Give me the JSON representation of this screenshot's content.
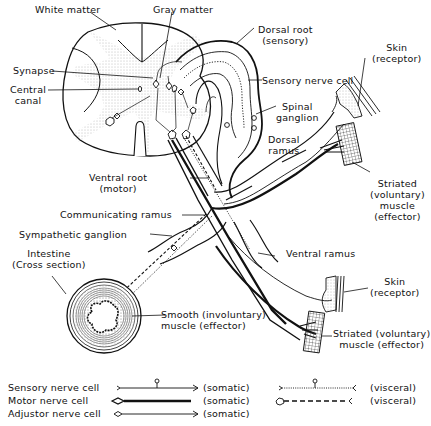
{
  "diagram": {
    "labels": {
      "white_matter": "White matter",
      "gray_matter": "Gray matter",
      "dorsal_root": "Dorsal root",
      "dorsal_root_sub": "(sensory)",
      "sensory_nerve_cell": "Sensory nerve cell",
      "synapse": "Synapse",
      "central_canal_1": "Central",
      "central_canal_2": "canal",
      "spinal_ganglion_1": "Spinal",
      "spinal_ganglion_2": "ganglion",
      "dorsal_ramus_1": "Dorsal",
      "dorsal_ramus_2": "ramus",
      "skin_top_1": "Skin",
      "skin_top_2": "(receptor)",
      "striated_top_1": "Striated",
      "striated_top_2": "(voluntary)",
      "striated_top_3": "muscle",
      "striated_top_4": "(effector)",
      "ventral_root_1": "Ventral root",
      "ventral_root_2": "(motor)",
      "communicating_ramus": "Communicating ramus",
      "sympathetic_ganglion": "Sympathetic ganglion",
      "intestine_1": "Intestine",
      "intestine_2": "(Cross section)",
      "ventral_ramus": "Ventral ramus",
      "smooth_1": "Smooth (involuntary)",
      "smooth_2": "muscle (effector)",
      "skin_bottom_1": "Skin",
      "skin_bottom_2": "(receptor)",
      "striated_bottom_1": "Striated (voluntary)",
      "striated_bottom_2": "muscle (effector)"
    }
  },
  "legend": {
    "rows": [
      {
        "name": "Sensory nerve cell",
        "somatic": "(somatic)",
        "visceral": "(visceral)"
      },
      {
        "name": "Motor nerve cell",
        "somatic": "(somatic)",
        "visceral": "(visceral)"
      },
      {
        "name": "Adjustor nerve cell",
        "somatic": "(somatic)"
      }
    ]
  },
  "colors": {
    "line": "#111111",
    "stipple": "#9a9a9a",
    "hatch": "#444444"
  }
}
